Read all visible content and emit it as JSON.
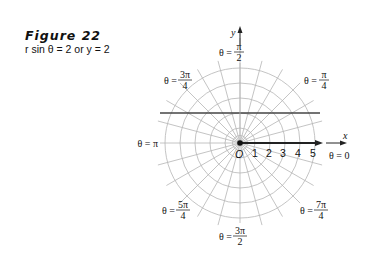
{
  "figure": {
    "title": "Figure 22",
    "caption": "r sin θ = 2 or y = 2"
  },
  "plot": {
    "origin_label": "O",
    "x_axis_label": "x",
    "y_axis_label": "y",
    "radial_ticks": [
      "1",
      "2",
      "3",
      "4",
      "5"
    ],
    "angle_labels": {
      "theta0": {
        "prefix": "θ = 0"
      },
      "pi_over_4": {
        "prefix": "θ =",
        "num": "π",
        "den": "4"
      },
      "pi_over_2": {
        "prefix": "θ =",
        "num": "π",
        "den": "2"
      },
      "three_pi_over_4": {
        "prefix": "θ =",
        "num": "3π",
        "den": "4"
      },
      "pi": {
        "prefix": "θ = π"
      },
      "five_pi_over_4": {
        "prefix": "θ =",
        "num": "5π",
        "den": "4"
      },
      "three_pi_over_2": {
        "prefix": "θ =",
        "num": "3π",
        "den": "2"
      },
      "seven_pi_over_4": {
        "prefix": "θ =",
        "num": "7π",
        "den": "4"
      }
    },
    "line_equation": "y = 2",
    "grid_color": "#b5b5b5",
    "line_color": "#444444"
  }
}
